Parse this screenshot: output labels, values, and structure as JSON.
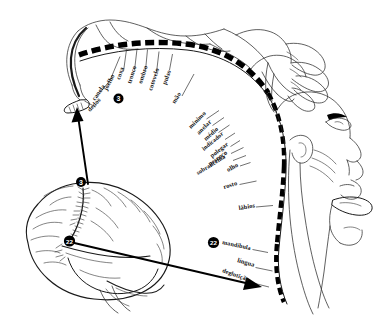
{
  "figure": {
    "background_color": "#ffffff",
    "ink_color": "#1a1a1a"
  },
  "cortical_arc": {
    "style": "dashed-band",
    "description": "faixa tracejada do córtex sensorial"
  },
  "labels_left": [
    {
      "text": "coxa",
      "x": 120,
      "y": 80,
      "rot": -72,
      "leader": {
        "x1": 123.5,
        "y1": 71.5,
        "x2": 126.5,
        "y2": 49.5
      }
    },
    {
      "text": "tronco",
      "x": 131,
      "y": 84,
      "rot": -72,
      "leader": {
        "x1": 134.5,
        "y1": 70.5,
        "x2": 137.0,
        "y2": 49.0
      }
    },
    {
      "text": "ombro",
      "x": 142,
      "y": 84,
      "rot": -72,
      "leader": {
        "x1": 145.5,
        "y1": 70.5,
        "x2": 147.5,
        "y2": 49.5
      }
    },
    {
      "text": "cotovelo",
      "x": 152,
      "y": 91,
      "rot": -72,
      "leader": {
        "x1": 156.5,
        "y1": 72.5,
        "x2": 159.0,
        "y2": 51.5
      }
    },
    {
      "text": "pulso",
      "x": 166,
      "y": 85,
      "rot": -70,
      "leader": {
        "x1": 169.5,
        "y1": 70.0,
        "x2": 172.5,
        "y2": 54.0
      }
    },
    {
      "text": "joelho",
      "x": 107,
      "y": 91,
      "rot": -63,
      "leader": {
        "x1": 111.0,
        "y1": 78.0,
        "x2": 120.0,
        "y2": 56.5
      }
    },
    {
      "text": "canela",
      "x": 95,
      "y": 101,
      "rot": -55,
      "leader": {
        "x1": 100.0,
        "y1": 92.5,
        "x2": 112.0,
        "y2": 78.0
      }
    },
    {
      "text": "dedos",
      "x": 90,
      "y": 112,
      "rot": -47,
      "leader": {
        "x1": 95.5,
        "y1": 107.0,
        "x2": 84.5,
        "y2": 101.0
      }
    }
  ],
  "labels_right": [
    {
      "text": "mão",
      "x": 175,
      "y": 104,
      "rot": -58,
      "leader": {
        "x1": 182.0,
        "y1": 96.0,
        "x2": 194.0,
        "y2": 74.0
      }
    },
    {
      "text": "mínimo",
      "x": 191,
      "y": 129,
      "rot": -45,
      "leader": {
        "x1": 206.5,
        "y1": 119.0,
        "x2": 219.0,
        "y2": 110.5
      }
    },
    {
      "text": "anelar",
      "x": 199,
      "y": 135,
      "rot": -45,
      "leader": {
        "x1": 212.5,
        "y1": 125.5,
        "x2": 224.0,
        "y2": 117.5
      }
    },
    {
      "text": "médio",
      "x": 206,
      "y": 141,
      "rot": -42,
      "leader": {
        "x1": 218.5,
        "y1": 132.5,
        "x2": 229.5,
        "y2": 125.0
      }
    },
    {
      "text": "indicador",
      "x": 204,
      "y": 151,
      "rot": -40,
      "leader": {
        "x1": 225.0,
        "y1": 139.5,
        "x2": 235.0,
        "y2": 133.0
      }
    },
    {
      "text": "polegar",
      "x": 212,
      "y": 158,
      "rot": -38,
      "leader": {
        "x1": 230.5,
        "y1": 146.5,
        "x2": 240.0,
        "y2": 140.5
      }
    },
    {
      "text": "pescoço",
      "x": 210,
      "y": 166,
      "rot": -35,
      "leader": {
        "x1": 231.0,
        "y1": 153.5,
        "x2": 243.5,
        "y2": 147.5
      }
    },
    {
      "text": "sobrancelha",
      "x": 198,
      "y": 175,
      "rot": -32,
      "leader": {
        "x1": 233.0,
        "y1": 160.5,
        "x2": 246.0,
        "y2": 155.5
      }
    },
    {
      "text": "olho",
      "x": 228,
      "y": 172,
      "rot": -28,
      "leader": {
        "x1": 240.0,
        "y1": 166.0,
        "x2": 250.5,
        "y2": 162.5
      }
    },
    {
      "text": "rosto",
      "x": 224,
      "y": 189,
      "rot": -17,
      "leader": {
        "x1": 239.5,
        "y1": 184.5,
        "x2": 256.5,
        "y2": 181.0
      }
    },
    {
      "text": "lábios",
      "x": 239,
      "y": 210,
      "rot": -9,
      "leader": {
        "x1": 256.0,
        "y1": 207.0,
        "x2": 273.0,
        "y2": 205.5
      }
    },
    {
      "text": "mandíbula",
      "x": 222,
      "y": 244,
      "rot": 12,
      "leader": {
        "x1": 252.5,
        "y1": 249.5,
        "x2": 268.0,
        "y2": 252.5
      }
    },
    {
      "text": "língua",
      "x": 237,
      "y": 262,
      "rot": 16,
      "leader": {
        "x1": 255.5,
        "y1": 267.5,
        "x2": 272.5,
        "y2": 271.0
      }
    },
    {
      "text": "deglutição",
      "x": 222,
      "y": 272,
      "rot": 20,
      "leader": {
        "x1": 255.0,
        "y1": 283.5,
        "x2": 269.0,
        "y2": 287.0
      }
    }
  ],
  "markers": [
    {
      "name": "arc-marker-3",
      "label": "3",
      "cx": 118.5,
      "cy": 98.5,
      "r": 5.0
    },
    {
      "name": "brain-marker-3",
      "label": "3",
      "cx": 81.0,
      "cy": 182.0,
      "r": 5.0
    },
    {
      "name": "brain-marker-22",
      "label": "22",
      "cx": 69.5,
      "cy": 241.0,
      "r": 5.6
    },
    {
      "name": "arc-marker-22",
      "label": "22",
      "cx": 213.5,
      "cy": 242.5,
      "r": 5.6
    }
  ],
  "arrows": [
    {
      "name": "arrow-area3-to-foot",
      "from_marker": "3",
      "to": "região do pé no córtex"
    },
    {
      "name": "arrow-area22-to-tongue",
      "from_marker": "22",
      "to": "região da língua/deglutição"
    }
  ],
  "anatomy": [
    {
      "name": "brain-lateral-view",
      "label": "encéfalo (vista lateral)"
    },
    {
      "name": "cerebellum",
      "label": "cerebelo"
    },
    {
      "name": "homunculus-body",
      "label": "corpo do homúnculo"
    },
    {
      "name": "homunculus-hand",
      "label": "mão ampliada"
    },
    {
      "name": "homunculus-face",
      "label": "face em perfil com boca aberta e língua"
    },
    {
      "name": "homunculus-foot",
      "label": "pé e perna"
    }
  ]
}
